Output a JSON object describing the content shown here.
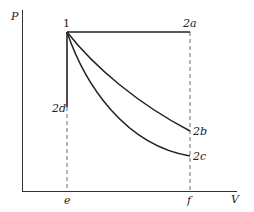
{
  "diagram": {
    "type": "PV diagram",
    "axes": {
      "y_label": "P",
      "x_label": "V"
    },
    "points": {
      "start": "1",
      "a": "2a",
      "b": "2b",
      "c": "2c",
      "d": "2d"
    },
    "volume_marks": {
      "left": "e",
      "right": "f"
    },
    "colors": {
      "line": "#222222",
      "background": "#ffffff"
    }
  }
}
